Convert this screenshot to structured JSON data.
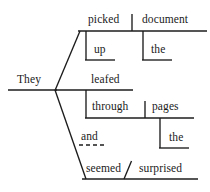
{
  "diagram": {
    "type": "reed-kellogg-sentence-diagram",
    "sentence": "They picked up the document and leafed through the pages seemed surprised",
    "ink_color": "#1a1a1a",
    "background_color": "#ffffff",
    "words": [
      {
        "id": "subject",
        "text": "They",
        "role": "subject",
        "x": 17,
        "y": 75
      },
      {
        "id": "verb1",
        "text": "picked",
        "role": "verb",
        "x": 88,
        "y": 15
      },
      {
        "id": "object1",
        "text": "document",
        "role": "direct-object",
        "x": 142,
        "y": 15
      },
      {
        "id": "particle1",
        "text": "up",
        "role": "particle-modifier",
        "x": 94,
        "y": 45
      },
      {
        "id": "determiner1",
        "text": "the",
        "role": "determiner-modifier",
        "x": 150,
        "y": 45
      },
      {
        "id": "verb2",
        "text": "leafed",
        "role": "verb",
        "x": 91,
        "y": 75
      },
      {
        "id": "preposition1",
        "text": "through",
        "role": "preposition",
        "x": 92,
        "y": 102
      },
      {
        "id": "object2",
        "text": "pages",
        "role": "object-of-preposition",
        "x": 152,
        "y": 102
      },
      {
        "id": "determiner2",
        "text": "the",
        "role": "determiner-modifier",
        "x": 168,
        "y": 133
      },
      {
        "id": "conjunction",
        "text": "and",
        "role": "coordinating-conjunction",
        "x": 81,
        "y": 132
      },
      {
        "id": "verb3",
        "text": "seemed",
        "role": "linking-verb",
        "x": 86,
        "y": 164
      },
      {
        "id": "complement",
        "text": "surprised",
        "role": "subject-complement",
        "x": 140,
        "y": 164
      }
    ],
    "lines": [
      {
        "id": "subject-baseline",
        "kind": "solid",
        "x1": 8,
        "y1": 90,
        "x2": 57,
        "y2": 90
      },
      {
        "id": "branch-up-diagonal",
        "kind": "solid",
        "x1": 55,
        "y1": 90,
        "x2": 80,
        "y2": 31
      },
      {
        "id": "branch-down-diagonal",
        "kind": "solid",
        "x1": 55,
        "y1": 90,
        "x2": 86,
        "y2": 179
      },
      {
        "id": "picked-baseline",
        "kind": "solid",
        "x1": 78,
        "y1": 31,
        "x2": 207,
        "y2": 31
      },
      {
        "id": "picked-object-divider",
        "kind": "solid",
        "x1": 132,
        "y1": 15,
        "x2": 132,
        "y2": 31
      },
      {
        "id": "up-stem",
        "kind": "solid",
        "x1": 86,
        "y1": 31,
        "x2": 86,
        "y2": 60
      },
      {
        "id": "up-underline",
        "kind": "solid",
        "x1": 86,
        "y1": 60,
        "x2": 114,
        "y2": 60
      },
      {
        "id": "the1-stem",
        "kind": "solid",
        "x1": 143,
        "y1": 31,
        "x2": 143,
        "y2": 60
      },
      {
        "id": "the1-underline",
        "kind": "solid",
        "x1": 143,
        "y1": 60,
        "x2": 171,
        "y2": 60
      },
      {
        "id": "leafed-baseline",
        "kind": "solid",
        "x1": 55,
        "y1": 90,
        "x2": 133,
        "y2": 90
      },
      {
        "id": "through-stem",
        "kind": "solid",
        "x1": 86,
        "y1": 90,
        "x2": 86,
        "y2": 118
      },
      {
        "id": "through-baseline",
        "kind": "solid",
        "x1": 86,
        "y1": 118,
        "x2": 194,
        "y2": 118
      },
      {
        "id": "pages-divider",
        "kind": "solid",
        "x1": 145,
        "y1": 102,
        "x2": 145,
        "y2": 118
      },
      {
        "id": "the2-stem",
        "kind": "solid",
        "x1": 160,
        "y1": 118,
        "x2": 160,
        "y2": 148
      },
      {
        "id": "the2-underline",
        "kind": "solid",
        "x1": 160,
        "y1": 148,
        "x2": 188,
        "y2": 148
      },
      {
        "id": "and-dashed-connector",
        "kind": "dashed",
        "x1": 79,
        "y1": 145,
        "x2": 103,
        "y2": 145
      },
      {
        "id": "seemed-baseline",
        "kind": "solid",
        "x1": 82,
        "y1": 179,
        "x2": 198,
        "y2": 179
      },
      {
        "id": "complement-slant",
        "kind": "solid",
        "x1": 124,
        "y1": 179,
        "x2": 131,
        "y2": 162
      }
    ]
  }
}
